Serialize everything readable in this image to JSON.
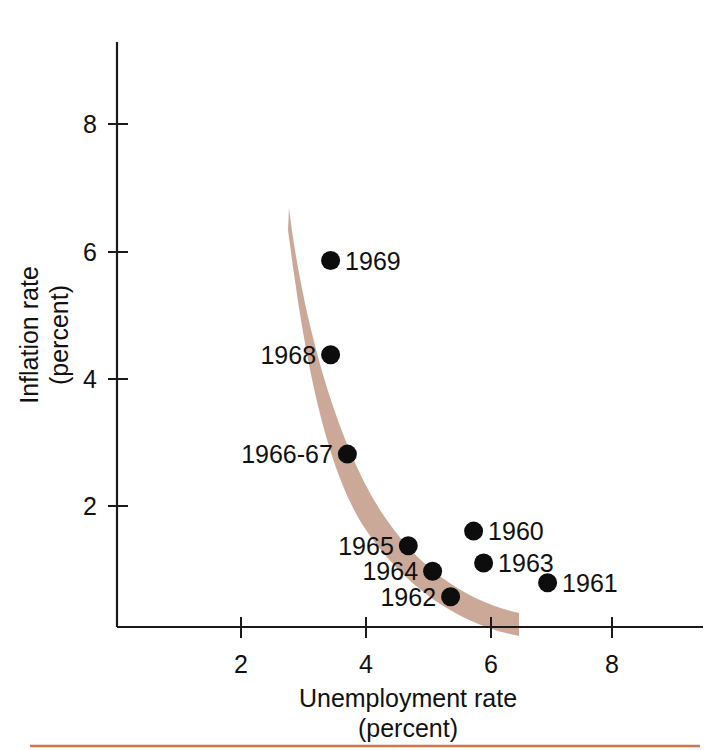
{
  "chart_data": {
    "type": "scatter",
    "title": "",
    "xlabel": "Unemployment rate",
    "xlabel_sub": "(percent)",
    "ylabel": "Inflation rate",
    "ylabel_sub": "(percent)",
    "xlim": [
      0,
      9.2
    ],
    "ylim": [
      0,
      9.3
    ],
    "xticks": [
      2,
      4,
      6,
      8
    ],
    "xtick_labels": [
      "2",
      "4",
      "6",
      "8"
    ],
    "yticks": [
      2,
      4,
      6,
      8
    ],
    "ytick_labels": [
      "2",
      "4",
      "6",
      "8"
    ],
    "grid": false,
    "legend": "none",
    "points": [
      {
        "label": "1969",
        "x": 3.44,
        "y": 5.85,
        "label_side": "right"
      },
      {
        "label": "1968",
        "x": 3.44,
        "y": 4.37,
        "label_side": "left"
      },
      {
        "label": "1966-67",
        "x": 3.71,
        "y": 2.81,
        "label_side": "left"
      },
      {
        "label": "1960",
        "x": 5.74,
        "y": 1.6,
        "label_side": "right"
      },
      {
        "label": "1965",
        "x": 4.69,
        "y": 1.37,
        "label_side": "left"
      },
      {
        "label": "1963",
        "x": 5.9,
        "y": 1.1,
        "label_side": "right"
      },
      {
        "label": "1964",
        "x": 5.08,
        "y": 0.97,
        "label_side": "left"
      },
      {
        "label": "1961",
        "x": 6.93,
        "y": 0.79,
        "label_side": "right"
      },
      {
        "label": "1962",
        "x": 5.37,
        "y": 0.57,
        "label_side": "left"
      }
    ],
    "band": {
      "name": "phillips-curve-band",
      "color": "#c8a391",
      "description": "shaded downward-sloping curve band fitted through the points"
    },
    "annotations": [
      {
        "name": "bottom-rule",
        "color": "#d0764a"
      }
    ]
  }
}
